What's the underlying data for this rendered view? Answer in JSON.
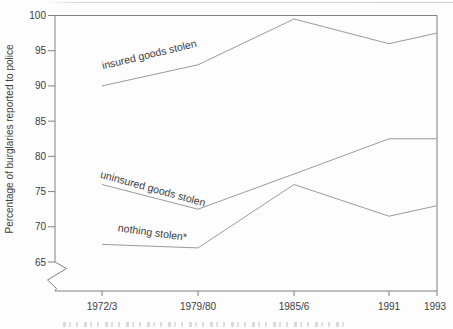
{
  "chart_data": {
    "type": "line",
    "title": "",
    "xlabel": "",
    "ylabel": "Percentage of burglaries reported to police",
    "categories": [
      "1972/3",
      "1979/80",
      "1985/6",
      "1991",
      "1993"
    ],
    "y_ticks": [
      65,
      70,
      75,
      80,
      85,
      90,
      95,
      100
    ],
    "ylim": [
      65,
      100
    ],
    "y_axis_break_below_min": true,
    "grid": false,
    "legend_position": "inline-labels-on-lines",
    "series": [
      {
        "name": "insured goods stolen",
        "values": [
          90,
          93,
          99.5,
          96,
          97.5
        ]
      },
      {
        "name": "uninsured goods stolen",
        "values": [
          76,
          72.5,
          77.5,
          82.5,
          82.5
        ]
      },
      {
        "name": "nothing stolen*",
        "values": [
          67.5,
          67,
          76,
          71.5,
          73
        ]
      }
    ]
  },
  "colors": {
    "axis": "#808080",
    "line": "#9b9b9b",
    "text": "#3c3c3c",
    "background": "#fdfdfd",
    "artifact": "#d6d6d6"
  },
  "footer": {
    "clipped_caption_illegible": true
  }
}
